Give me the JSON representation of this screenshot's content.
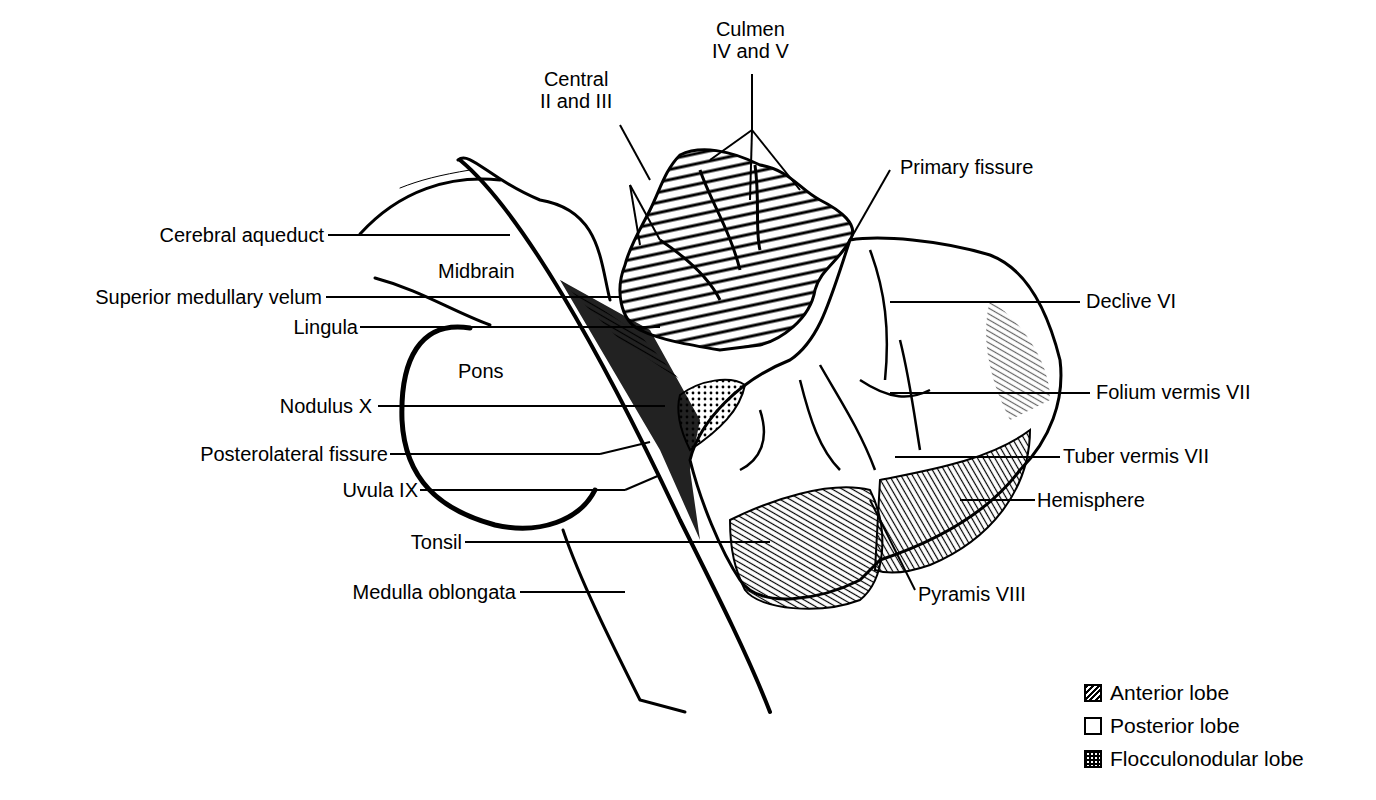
{
  "figure": {
    "top_labels": [
      {
        "id": "culmen",
        "lines": [
          "Culmen",
          "IV and V"
        ]
      },
      {
        "id": "central",
        "lines": [
          "Central",
          "II and III"
        ]
      }
    ],
    "left_labels": [
      {
        "id": "cerebral-aqueduct",
        "text": "Cerebral aqueduct"
      },
      {
        "id": "superior-medullary-velum",
        "text": "Superior medullary velum"
      },
      {
        "id": "lingula",
        "text": "Lingula"
      },
      {
        "id": "nodulus",
        "text": "Nodulus X"
      },
      {
        "id": "posterolateral-fissure",
        "text": "Posterolateral fissure"
      },
      {
        "id": "uvula",
        "text": "Uvula IX"
      },
      {
        "id": "tonsil",
        "text": "Tonsil"
      },
      {
        "id": "medulla-oblongata",
        "text": "Medulla oblongata"
      }
    ],
    "right_labels": [
      {
        "id": "primary-fissure",
        "text": "Primary fissure"
      },
      {
        "id": "declive",
        "text": "Declive VI"
      },
      {
        "id": "folium-vermis",
        "text": "Folium vermis VII"
      },
      {
        "id": "tuber-vermis",
        "text": "Tuber vermis VII"
      },
      {
        "id": "hemisphere",
        "text": "Hemisphere"
      },
      {
        "id": "pyramis",
        "text": "Pyramis VIII"
      }
    ],
    "region_labels": [
      {
        "id": "midbrain",
        "text": "Midbrain"
      },
      {
        "id": "pons",
        "text": "Pons"
      }
    ]
  },
  "legend": {
    "items": [
      {
        "id": "anterior-lobe",
        "label": "Anterior lobe",
        "pattern": "hatched"
      },
      {
        "id": "posterior-lobe",
        "label": "Posterior lobe",
        "pattern": "blank"
      },
      {
        "id": "flocculonodular-lobe",
        "label": "Flocculonodular lobe",
        "pattern": "stippled"
      }
    ]
  }
}
